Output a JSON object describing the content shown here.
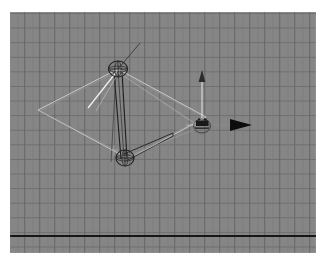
{
  "app": {
    "window_title": "3D Viewport",
    "view_label": "perspective"
  },
  "viewport": {
    "background_color": "#868686",
    "grid_line_color": "#5a5a5a",
    "grid_minor_color": "#767676",
    "grid_cell_px": 15,
    "ground_axis_color": "#111111"
  },
  "scene": {
    "objects": [
      {
        "name": "ground-plane-wireframe",
        "type": "quad-wireframe",
        "color": "#d9d9d9",
        "vertices": [
          [
            28,
            98
          ],
          [
            108,
            57
          ],
          [
            196,
            105
          ],
          [
            119,
            147
          ]
        ]
      },
      {
        "name": "joint-upper",
        "type": "joint-sphere",
        "color": "#2b2b2b",
        "center": [
          108,
          57
        ],
        "radius": 9
      },
      {
        "name": "joint-lower",
        "type": "joint-sphere",
        "color": "#2b2b2b",
        "center": [
          115,
          146
        ],
        "radius": 9
      },
      {
        "name": "bone-upper-to-lower",
        "type": "bone",
        "color": "#1e1e1e",
        "from": [
          108,
          57
        ],
        "to": [
          115,
          146
        ]
      },
      {
        "name": "bone-lower-to-effector",
        "type": "bone",
        "color": "#1f1f1f",
        "from": [
          115,
          146
        ],
        "to": [
          160,
          125
        ]
      },
      {
        "name": "ik-handle-line",
        "type": "line",
        "color": "#e8e8e8",
        "from": [
          108,
          57
        ],
        "to": [
          78,
          95
        ]
      },
      {
        "name": "joint-orient-axis",
        "type": "line",
        "color": "#3a3a3a",
        "from": [
          108,
          57
        ],
        "to": [
          128,
          33
        ]
      },
      {
        "name": "origin-locator",
        "type": "locator",
        "color": "#a8a8a8",
        "center": [
          104,
          138
        ]
      }
    ]
  },
  "manipulator": {
    "name": "translate-manipulator",
    "center_x": 192,
    "center_y": 113,
    "center_handle_label": "XYZ",
    "handles": [
      {
        "name": "x-axis-handle",
        "axis": "X",
        "direction": "right",
        "color": "#0d0d0d",
        "length": 48
      },
      {
        "name": "y-axis-handle",
        "axis": "Y",
        "direction": "up",
        "color": "#d8d8d8",
        "length": 42
      }
    ]
  },
  "ground_axis": {
    "name": "ground-axis-line",
    "y": 224,
    "color": "#141414",
    "thickness": 2
  }
}
